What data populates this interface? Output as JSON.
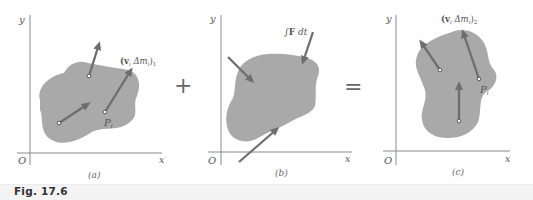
{
  "figure": {
    "caption": "Fig. 17.6",
    "colors": {
      "blob_fill": "#a9a9a9",
      "arrow": "#6e6e6e",
      "axis": "#8a8a8a",
      "text": "#555555",
      "caption_band": "#f4f4f4"
    },
    "operators": {
      "plus": "+",
      "equals": "="
    },
    "panels": [
      {
        "id": "a",
        "label": "(a)",
        "axis_x": "x",
        "axis_y": "y",
        "origin": "O",
        "vector_label_main": "(v",
        "vector_label_sub_i": "i",
        "vector_label_mid": " Δm",
        "vector_label_sub_i2": "i",
        "vector_label_close": ")",
        "vector_label_index": "1",
        "point_label": "P",
        "point_sub": "i"
      },
      {
        "id": "b",
        "label": "(b)",
        "axis_x": "x",
        "axis_y": "y",
        "origin": "O",
        "impulse_label_int": "∫",
        "impulse_label_F": "F",
        "impulse_label_dt": " dt"
      },
      {
        "id": "c",
        "label": "(c)",
        "axis_x": "x",
        "axis_y": "y",
        "origin": "O",
        "vector_label_main": "(v",
        "vector_label_sub_i": "i",
        "vector_label_mid": " Δm",
        "vector_label_sub_i2": "i",
        "vector_label_close": ")",
        "vector_label_index": "2",
        "point_label": "P",
        "point_sub": "i"
      }
    ]
  }
}
